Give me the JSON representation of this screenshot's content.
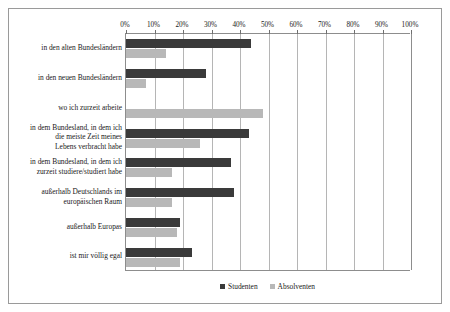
{
  "chart_data": {
    "type": "bar",
    "orientation": "horizontal",
    "title": "",
    "xlabel": "",
    "ylabel": "",
    "xlim": [
      0,
      100
    ],
    "xtick_labels": [
      "0%",
      "10%",
      "20%",
      "30%",
      "40%",
      "50%",
      "60%",
      "70%",
      "80%",
      "90%",
      "100%"
    ],
    "xticks": [
      0,
      10,
      20,
      30,
      40,
      50,
      60,
      70,
      80,
      90,
      100
    ],
    "grid": true,
    "legend_position": "bottom",
    "categories": [
      "in den alten Bundesländern",
      "in den neuen Bundesländern",
      "wo ich zurzeit arbeite",
      "in dem Bundesland, in dem ich die meiste Zeit meines Lebens verbracht habe",
      "in dem Bundesland, in dem ich zurzeit studiere/studiert habe",
      "außerhalb Deutschlands im europäischen Raum",
      "außerhalb Europas",
      "ist mir völlig egal"
    ],
    "category_lines": [
      [
        "in den alten Bundesländern"
      ],
      [
        "in den neuen Bundesländern"
      ],
      [
        "wo ich zurzeit arbeite"
      ],
      [
        "in dem Bundesland, in dem ich",
        "die meiste Zeit meines",
        "Lebens verbracht habe"
      ],
      [
        "in dem Bundesland, in dem ich",
        "zurzeit studiere/studiert habe"
      ],
      [
        "außerhalb Deutschlands im",
        "europäischen Raum"
      ],
      [
        "außerhalb Europas"
      ],
      [
        "ist mir völlig egal"
      ]
    ],
    "series": [
      {
        "name": "Studenten",
        "color": "#3a3a3a",
        "values": [
          44,
          28,
          0,
          43,
          37,
          38,
          19,
          23
        ]
      },
      {
        "name": "Absolventen",
        "color": "#b8b8b8",
        "values": [
          14,
          7,
          48,
          26,
          16,
          16,
          18,
          19
        ]
      }
    ]
  },
  "legend": {
    "entries": [
      {
        "label": "Studenten",
        "color": "#3a3a3a"
      },
      {
        "label": "Absolventen",
        "color": "#b8b8b8"
      }
    ]
  },
  "colors": {
    "studenten": "#3a3a3a",
    "absolventen": "#b8b8b8",
    "gridline": "#b5b5b5",
    "axis": "#8d8d8d",
    "frame": "#9a9a9a",
    "background": "#ffffff"
  }
}
